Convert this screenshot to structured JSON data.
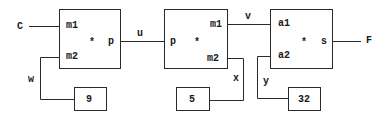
{
  "diagram": {
    "inputs": {
      "left": "C"
    },
    "outputs": {
      "right": "F"
    },
    "blocks": [
      {
        "id": "block1",
        "ports_in": [
          "m1",
          "m2"
        ],
        "op": "*",
        "port_out": "p"
      },
      {
        "id": "block2",
        "port_in": "p",
        "op": "*",
        "ports_out": [
          "m1",
          "m2"
        ]
      },
      {
        "id": "block3",
        "ports_in": [
          "a1",
          "a2"
        ],
        "op": "*",
        "port_out": "s"
      }
    ],
    "constants": [
      {
        "value": "9",
        "wire": "w"
      },
      {
        "value": "5",
        "wire": "x"
      },
      {
        "value": "32",
        "wire": "y"
      }
    ],
    "wires": {
      "u": "u",
      "v": "v"
    },
    "colors": {
      "stroke": "#2a2a2a",
      "text": "#1a1a1a",
      "background": "#ffffff"
    }
  }
}
